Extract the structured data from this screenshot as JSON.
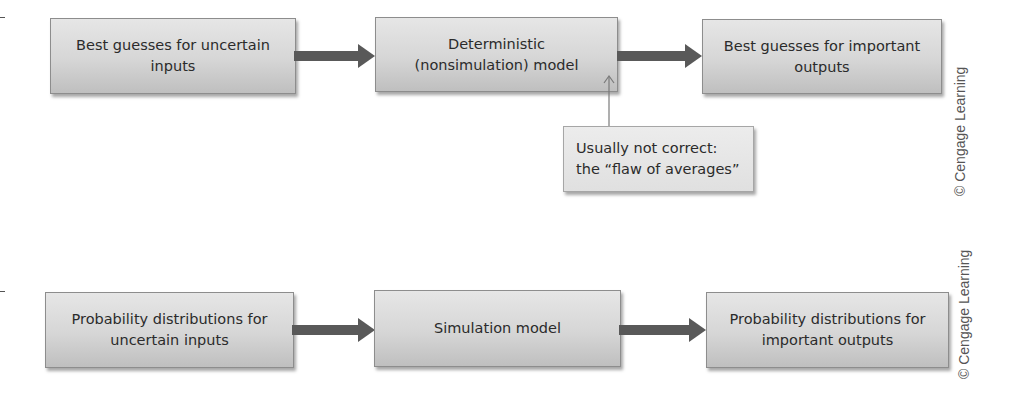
{
  "diagram": {
    "top_row": {
      "boxes": [
        {
          "label": "Best guesses for uncertain inputs"
        },
        {
          "label": "Deterministic (nonsimulation) model"
        },
        {
          "label": "Best guesses for important outputs"
        }
      ],
      "callout": {
        "label": "Usually not correct: the “flaw of averages”"
      },
      "watermark": "© Cengage Learning"
    },
    "bottom_row": {
      "boxes": [
        {
          "label": "Probability distributions for uncertain inputs"
        },
        {
          "label": "Simulation model"
        },
        {
          "label": "Probability distributions for important outputs"
        }
      ],
      "watermark": "© Cengage Learning"
    },
    "colors": {
      "box_fill": "#d6d6d6",
      "box_border": "#8d8d8d",
      "arrow": "#595959",
      "text": "#2b2b2b"
    }
  }
}
